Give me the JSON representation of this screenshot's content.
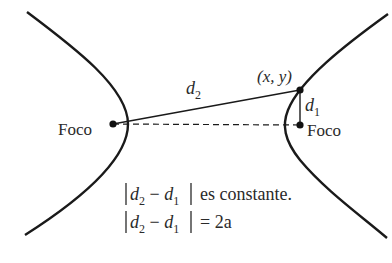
{
  "diagram": {
    "type": "hyperbola",
    "labels": {
      "focus_left": "Foco",
      "focus_right": "Foco",
      "point": "(x, y)",
      "d2": {
        "base": "d",
        "sub": "2"
      },
      "d1": {
        "base": "d",
        "sub": "1"
      }
    },
    "equations": {
      "line1": {
        "text": "|d2 − d1| es constante.",
        "suffix": "es constante."
      },
      "line2": {
        "text": "|d2 − d1| = 2a",
        "suffix": "= 2a"
      }
    },
    "colors": {
      "stroke": "#1a1a1a",
      "text": "#2a2a2a",
      "background": "#ffffff"
    }
  }
}
